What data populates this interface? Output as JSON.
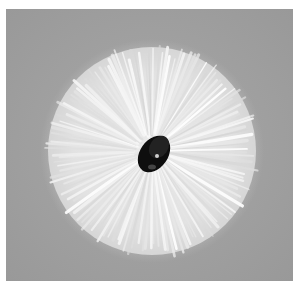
{
  "image": {
    "subject": "end-on view of a round bristle brush with white radial bristles and a dark central twisted wire core",
    "colors": {
      "background": "#9e9e9e",
      "border": "#ffffff",
      "bristles": "#f2f2f2",
      "core": "#111111"
    }
  }
}
